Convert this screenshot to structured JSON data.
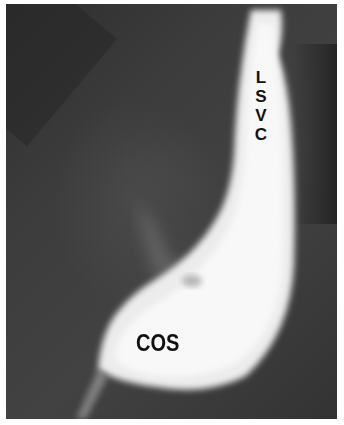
{
  "image": {
    "description": "Contrast venogram showing persistent left superior vena cava draining into dilated coronary sinus",
    "labels": {
      "lsvc": [
        "L",
        "S",
        "V",
        "C"
      ],
      "cos": "COS"
    }
  },
  "colors": {
    "background": "#3a3a3a",
    "contrast": "#f4f4f4",
    "label": "#111111",
    "border": "#ffffff"
  }
}
